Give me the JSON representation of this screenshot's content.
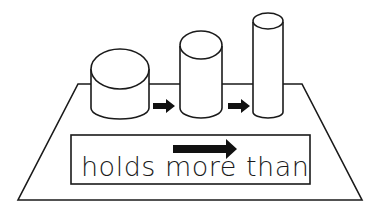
{
  "diagram": {
    "colors": {
      "stroke": "#1a1a1a",
      "fill": "#ffffff",
      "arrow": "#111111"
    },
    "cylinders": [
      {
        "id": "short-wide",
        "order": 1
      },
      {
        "id": "medium",
        "order": 2
      },
      {
        "id": "tall-narrow",
        "order": 3
      }
    ],
    "arrows": [
      {
        "id": "arrow-1",
        "from": "short-wide",
        "to": "medium"
      },
      {
        "id": "arrow-2",
        "from": "medium",
        "to": "tall-narrow"
      }
    ],
    "label": {
      "words": [
        "holds",
        "more",
        "than"
      ],
      "arrow_over": "more"
    }
  }
}
